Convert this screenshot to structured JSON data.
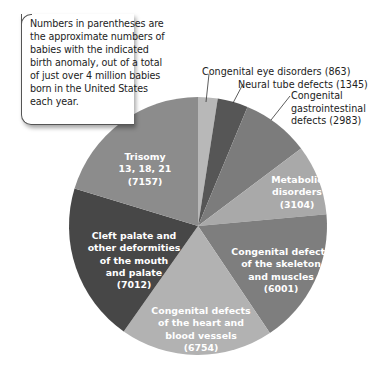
{
  "note": {
    "text": "Numbers in parentheses are the approximate numbers of babies with the indicated birth anomaly, out of a total of just over 4 million babies born in the United States each year."
  },
  "chart_data": {
    "type": "pie",
    "title": "",
    "start_angle_deg": 0,
    "direction": "clockwise",
    "slices": [
      {
        "label": "Congenital eye disorders",
        "value": 863,
        "color": "#b8b8b8"
      },
      {
        "label": "Neural tube defects",
        "value": 1345,
        "color": "#565656"
      },
      {
        "label": "Congenital gastrointestinal defects",
        "value": 2983,
        "color": "#7c7c7c"
      },
      {
        "label": "Metabolic disorders",
        "value": 3104,
        "color": "#a9a9a9"
      },
      {
        "label": "Congenital defects of the skeleton and muscles",
        "value": 6001,
        "color": "#7e7e7e"
      },
      {
        "label": "Congenital defects of the heart and blood vessels",
        "value": 6754,
        "color": "#b2b2b2"
      },
      {
        "label": "Cleft palate and other deformities of the mouth and palate",
        "value": 7012,
        "color": "#474747"
      },
      {
        "label": "Trisomy 13, 18, 21",
        "value": 7157,
        "color": "#8c8c8c"
      }
    ]
  },
  "labels": {
    "eye": "Congenital eye disorders (863)",
    "neural": "Neural tube defects (1345)",
    "gi_1": "Congenital",
    "gi_2": "gastrointestinal",
    "gi_3": "defects (2983)",
    "metabolic_1": "Metabolic",
    "metabolic_2": "disorders",
    "metabolic_3": "(3104)",
    "skeleton_1": "Congenital defects",
    "skeleton_2": "of the skeleton",
    "skeleton_3": "and muscles",
    "skeleton_4": "(6001)",
    "heart_1": "Congenital defects",
    "heart_2": "of the heart and",
    "heart_3": "blood vessels",
    "heart_4": "(6754)",
    "cleft_1": "Cleft palate and",
    "cleft_2": "other deformities",
    "cleft_3": "of the mouth",
    "cleft_4": "and palate",
    "cleft_5": "(7012)",
    "trisomy_1": "Trisomy",
    "trisomy_2": "13, 18, 21",
    "trisomy_3": "(7157)"
  }
}
